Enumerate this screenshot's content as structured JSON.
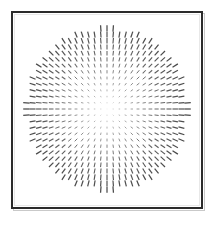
{
  "figure": {
    "title": "",
    "background_color": "#ffffff",
    "frame_color": "#2b2b2b",
    "frame_shadow_color": "#c9c9c9",
    "segment_color": "#4a4a4a",
    "width_px": 215,
    "height_px": 225
  },
  "panel": {
    "left_px": 11,
    "top_px": 11,
    "width_px": 192,
    "height_px": 198,
    "border_width_px": 2
  },
  "chart_data": {
    "type": "scatter",
    "plot_style": "radial-line-segment-field",
    "title": "",
    "subtitle": "",
    "xlabel": "",
    "ylabel": "",
    "grid": false,
    "legend": null,
    "axes_visible": false,
    "tick_labels_x": [],
    "tick_labels_y": [],
    "xlim": [
      -1,
      1
    ],
    "ylim": [
      -1,
      1
    ],
    "center_x_px": 107,
    "center_y_px": 109,
    "aperture_radius_px": 81,
    "grid_spacing_px": 6.2,
    "grid_columns": 27,
    "grid_rows": 27,
    "orientation_rule": "radial",
    "orientation_description": "Each segment is aligned along the radius from the field center; vertical on the central vertical axis, horizontal on the central horizontal axis, 45 degrees on the diagonals.",
    "length_rule": "proportional-to-radius",
    "length_min_px": 0.6,
    "length_max_px": 6.4,
    "stroke_width_min_px": 0.6,
    "stroke_width_max_px": 1.25,
    "opacity_min": 0.22,
    "opacity_max": 1.0,
    "clip_shape": "circle",
    "segment_count_estimate": 545
  }
}
